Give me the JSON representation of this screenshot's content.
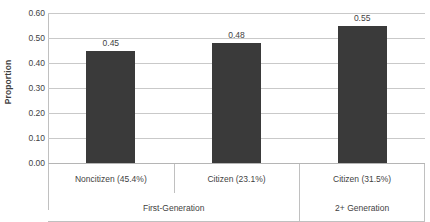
{
  "chart_data": {
    "type": "bar",
    "title": "",
    "xlabel": "",
    "ylabel": "Proportion",
    "ylim": [
      0.0,
      0.6
    ],
    "ytick_step": 0.1,
    "grid": true,
    "legend": false,
    "bar_color": "#3a3a3a",
    "categories": [
      "Noncitizen (45.4%)",
      "Citizen (23.1%)",
      "Citizen (31.5%)"
    ],
    "values": [
      0.45,
      0.48,
      0.55
    ],
    "value_labels": [
      "0.45",
      "0.48",
      "0.55"
    ],
    "ytick_labels": [
      "0.60",
      "0.50",
      "0.40",
      "0.30",
      "0.20",
      "0.10",
      "0.00"
    ],
    "ytick_values": [
      0.6,
      0.5,
      0.4,
      0.3,
      0.2,
      0.1,
      0.0
    ],
    "groups": [
      {
        "label": "First-Generation",
        "span": 2
      },
      {
        "label": "2+ Generation",
        "span": 1
      }
    ]
  }
}
